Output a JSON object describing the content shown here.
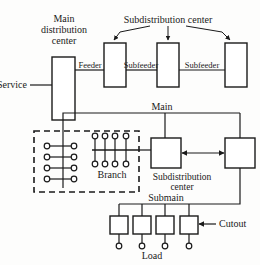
{
  "diagram": {
    "labels": {
      "service": "Service",
      "main_distribution_center_line1": "Main",
      "main_distribution_center_line2": "distribution",
      "main_distribution_center_line3": "center",
      "subdistribution_center_top": "Subdistribution center",
      "feeder": "Feeder",
      "subfeeder_1": "Subfeeder",
      "subfeeder_2": "Subfeeder",
      "main": "Main",
      "branch": "Branch",
      "subdistribution_center_line1": "Subdistribution",
      "subdistribution_center_line2": "center",
      "submain": "Submain",
      "cutout": "Cutout",
      "load": "Load"
    },
    "colors": {
      "stroke": "#1a1a1a",
      "background": "#fdfdfc",
      "box_fill": "#ffffff"
    },
    "counts": {
      "top_subdistribution_boxes": 3,
      "branch_left_rows": 4,
      "branch_comb_stems": 4,
      "mid_subdistribution_boxes": 2,
      "load_boxes": 4
    }
  }
}
